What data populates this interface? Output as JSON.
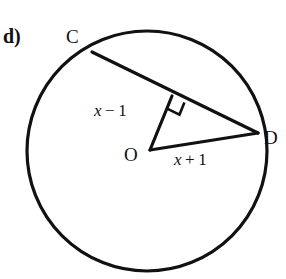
{
  "figure": {
    "part_label": "d)",
    "points": {
      "c": "C",
      "d": "D",
      "o": "O"
    },
    "labels": {
      "chord_segment": "x − 1",
      "radius_segment": "x + 1",
      "chord_segment_var": "x",
      "chord_segment_op": "−",
      "chord_segment_num": "1",
      "radius_segment_var": "x",
      "radius_segment_op": "+",
      "radius_segment_num": "1"
    },
    "colors": {
      "stroke": "#111111",
      "background": "#ffffff"
    },
    "geometry": {
      "circle": {
        "cx": 147,
        "cy": 151,
        "r": 120
      },
      "point_c": {
        "x": 92,
        "y": 52
      },
      "point_d": {
        "x": 258,
        "y": 133
      },
      "point_o": {
        "x": 150,
        "y": 150
      },
      "perpendicular_foot": {
        "x": 172,
        "y": 96
      },
      "right_angle_marker": "square"
    }
  }
}
